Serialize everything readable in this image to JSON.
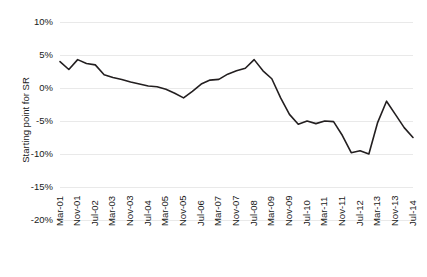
{
  "chart_data": {
    "type": "line",
    "title": "",
    "xlabel": "",
    "ylabel": "Starting point for SR",
    "ylim": [
      -20,
      10
    ],
    "ytick_values": [
      10,
      5,
      0,
      -5,
      -10,
      -15,
      -20
    ],
    "ytick_labels": [
      "10%",
      "5%",
      "0%",
      "-5%",
      "-10%",
      "-15%",
      "-20%"
    ],
    "grid": "horizontal",
    "legend": "none",
    "xtick_labels": [
      "Mar-01",
      "Nov-01",
      "Jul-02",
      "Mar-03",
      "Nov-03",
      "Jul-04",
      "Mar-05",
      "Nov-05",
      "Jul-06",
      "Mar-07",
      "Nov-07",
      "Jul-08",
      "Mar-09",
      "Nov-09",
      "Jul-10",
      "Mar-11",
      "Nov-11",
      "Jul-12",
      "Mar-13",
      "Nov-13",
      "Jul-14"
    ],
    "xtick_interval_months": 8,
    "x_start": "Mar-01",
    "x_end": "Jul-14",
    "series": [
      {
        "name": "Starting point for SR",
        "color": "#231f20",
        "x": [
          "Mar-01",
          "Jul-01",
          "Nov-01",
          "Mar-02",
          "Jul-02",
          "Nov-02",
          "Mar-03",
          "Jul-03",
          "Nov-03",
          "Mar-04",
          "Jul-04",
          "Nov-04",
          "Mar-05",
          "Jul-05",
          "Nov-05",
          "Mar-06",
          "Jul-06",
          "Nov-06",
          "Mar-07",
          "Jul-07",
          "Nov-07",
          "Mar-08",
          "Jul-08",
          "Nov-08",
          "Mar-09",
          "Jul-09",
          "Nov-09",
          "Mar-10",
          "Jul-10",
          "Nov-10",
          "Mar-11",
          "Jul-11",
          "Nov-11",
          "Mar-12",
          "Jul-12",
          "Nov-12",
          "Mar-13",
          "Jul-13",
          "Nov-13",
          "Mar-14",
          "Jul-14"
        ],
        "values": [
          4.0,
          2.8,
          4.3,
          3.7,
          3.5,
          2.0,
          1.6,
          1.3,
          0.9,
          0.6,
          0.3,
          0.2,
          -0.2,
          -0.8,
          -1.5,
          -0.5,
          0.6,
          1.2,
          1.3,
          2.1,
          2.6,
          3.0,
          4.3,
          2.6,
          1.4,
          -1.5,
          -4.0,
          -5.5,
          -5.0,
          -5.4,
          -5.0,
          -5.1,
          -7.2,
          -9.8,
          -9.5,
          -10.0,
          -5.2,
          -2.0,
          -4.0,
          -6.0,
          -7.5
        ]
      }
    ]
  }
}
